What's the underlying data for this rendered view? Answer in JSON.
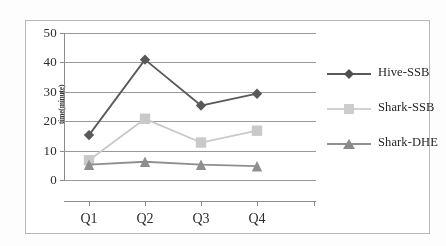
{
  "chart_data": {
    "type": "line",
    "title": "",
    "subtitle": "",
    "xlabel": "",
    "ylabel": "time(minute)",
    "categories": [
      "Q1",
      "Q2",
      "Q3",
      "Q4"
    ],
    "ylim": [
      0,
      50
    ],
    "y_ticks": [
      0,
      10,
      20,
      30,
      40,
      50
    ],
    "y_tick_labels": [
      "0",
      "10",
      "20",
      "30",
      "40",
      "50"
    ],
    "grid": "horizontal",
    "legend_position": "right",
    "series": [
      {
        "name": "Hive-SSB",
        "values": [
          15.5,
          41,
          25.5,
          29.5
        ],
        "color": "#595959",
        "marker": "diamond"
      },
      {
        "name": "Shark-SSB",
        "values": [
          7,
          21,
          13,
          17
        ],
        "color": "#c9c9c9",
        "marker": "square"
      },
      {
        "name": "Shark-DHE",
        "values": [
          5.5,
          6.5,
          5.5,
          5
        ],
        "color": "#8f8f8f",
        "marker": "triangle"
      }
    ]
  },
  "axis": {
    "y_label": "time(minute)",
    "ticks": [
      {
        "label": "50"
      },
      {
        "label": "40"
      },
      {
        "label": "30"
      },
      {
        "label": "20"
      },
      {
        "label": "10"
      },
      {
        "label": "0"
      }
    ],
    "x_labels": [
      {
        "label": "Q1"
      },
      {
        "label": "Q2"
      },
      {
        "label": "Q3"
      },
      {
        "label": "Q4"
      }
    ]
  },
  "legend": {
    "items": [
      {
        "label": "Hive-SSB"
      },
      {
        "label": "Shark-SSB"
      },
      {
        "label": "Shark-DHE"
      }
    ]
  }
}
